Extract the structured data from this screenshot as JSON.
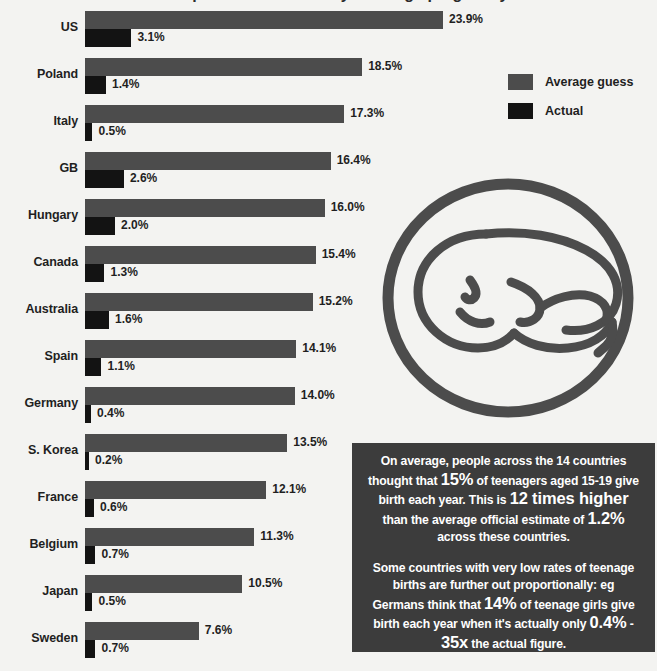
{
  "page": {
    "title_sliver": "Perceptions are not reality: Teenage pregnancy",
    "background": "#f3f3f1"
  },
  "colors": {
    "guess_bar": "#4c4c4c",
    "actual_bar": "#131313",
    "callout_bg": "#3c3c3c",
    "text": "#1f1f1f",
    "callout_text": "#ffffff",
    "icon": "#4c4c4c"
  },
  "legend": {
    "items": [
      {
        "label": "Average guess",
        "color": "#4c4c4c",
        "key": "guess"
      },
      {
        "label": "Actual",
        "color": "#131313",
        "key": "actual"
      }
    ]
  },
  "icon": {
    "name": "baby-in-circle-icon",
    "description": "Outline of a sleeping baby inside a ring"
  },
  "callout": {
    "paragraph1_parts": [
      {
        "text": "On average, people across the 14 countries thought that ",
        "bold": false
      },
      {
        "text": "15%",
        "bold": true
      },
      {
        "text": " of teenagers aged 15-19 give birth each year. This is ",
        "bold": false
      },
      {
        "text": "12 times higher",
        "bold": true
      },
      {
        "text": " than the average official estimate of ",
        "bold": false
      },
      {
        "text": "1.2%",
        "bold": true
      },
      {
        "text": " across these countries.",
        "bold": false
      }
    ],
    "paragraph2_parts": [
      {
        "text": "Some countries with very low rates of teenage births are further out proportionally: eg Germans think that ",
        "bold": false
      },
      {
        "text": "14%",
        "bold": true
      },
      {
        "text": " of teenage girls give birth each year when it's actually only ",
        "bold": false
      },
      {
        "text": "0.4%",
        "bold": true
      },
      {
        "text": " - ",
        "bold": false
      },
      {
        "text": "35x",
        "bold": true
      },
      {
        "text": " the actual figure.",
        "bold": false
      }
    ],
    "paragraph1_plain": "On average, people across the 14 countries thought that 15% of teenagers aged 15-19 give birth each year. This is 12 times higher than the average official estimate of 1.2% across these countries.",
    "paragraph2_plain": "Some countries with very low rates of teenage births are further out proportionally: eg Germans think that 14% of teenage girls give birth each year when it's actually only 0.4% - 35x the actual figure."
  },
  "chart_data": {
    "type": "bar",
    "orientation": "horizontal",
    "title": "",
    "xlabel": "",
    "ylabel": "",
    "xlim": [
      0,
      23.9
    ],
    "grid": false,
    "legend_position": "top-right",
    "value_suffix": "%",
    "categories": [
      "US",
      "Poland",
      "Italy",
      "GB",
      "Hungary",
      "Canada",
      "Australia",
      "Spain",
      "Germany",
      "S. Korea",
      "France",
      "Belgium",
      "Japan",
      "Sweden"
    ],
    "series": [
      {
        "name": "Average guess",
        "color": "#4c4c4c",
        "values": [
          23.9,
          18.5,
          17.3,
          16.4,
          16.0,
          15.4,
          15.2,
          14.1,
          14.0,
          13.5,
          12.1,
          11.3,
          10.5,
          7.6
        ],
        "labels": [
          "23.9%",
          "18.5%",
          "17.3%",
          "16.4%",
          "16.0%",
          "15.4%",
          "15.2%",
          "14.1%",
          "14.0%",
          "13.5%",
          "12.1%",
          "11.3%",
          "10.5%",
          "7.6%"
        ]
      },
      {
        "name": "Actual",
        "color": "#131313",
        "values": [
          3.1,
          1.4,
          0.5,
          2.6,
          2.0,
          1.3,
          1.6,
          1.1,
          0.4,
          0.2,
          0.6,
          0.7,
          0.5,
          0.7
        ],
        "labels": [
          "3.1%",
          "1.4%",
          "0.5%",
          "2.6%",
          "2.0%",
          "1.3%",
          "1.6%",
          "1.1%",
          "0.4%",
          "0.2%",
          "0.6%",
          "0.7%",
          "0.5%",
          "0.7%"
        ]
      }
    ]
  }
}
